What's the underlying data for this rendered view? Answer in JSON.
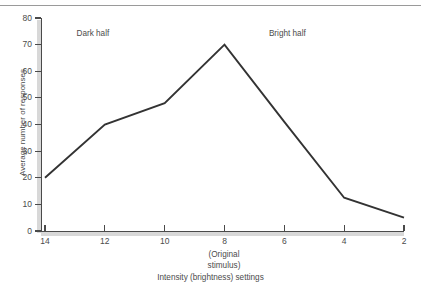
{
  "figure": {
    "top_rule": true,
    "line_color": "#333333",
    "axis_color": "#4a4a4a",
    "axis_shadow_color": "#d8d8d8",
    "text_color": "#4b4b4b",
    "background": "#ffffff"
  },
  "chart_data": {
    "type": "line",
    "title": "",
    "subtitle": "",
    "xlabel": "Intensity (brightness) settings",
    "xlabel_note_line1": "(Original",
    "xlabel_note_line2": "stimulus)",
    "ylabel": "Average number of responses",
    "x": [
      14,
      12,
      10,
      8,
      6,
      4,
      2
    ],
    "xtick_labels": [
      "14",
      "12",
      "10",
      "8",
      "6",
      "4",
      "2"
    ],
    "ytick_labels": [
      "0",
      "10",
      "20",
      "30",
      "40",
      "50",
      "60",
      "70",
      "80"
    ],
    "yticks": [
      0,
      10,
      20,
      30,
      40,
      50,
      60,
      70,
      80
    ],
    "xlim": [
      14,
      2
    ],
    "ylim": [
      0,
      80
    ],
    "x_axis_direction": "descending",
    "grid": false,
    "legend": false,
    "legend_position": "none",
    "series": [
      {
        "name": "Average number of responses",
        "values": [
          20,
          40,
          48,
          70,
          41,
          12.5,
          5
        ]
      }
    ],
    "annotations": [
      {
        "text": "Dark half",
        "x": 12.4,
        "y": 74,
        "name": "dark-half-label"
      },
      {
        "text": "Bright half",
        "x": 5.9,
        "y": 74,
        "name": "bright-half-label"
      }
    ]
  }
}
